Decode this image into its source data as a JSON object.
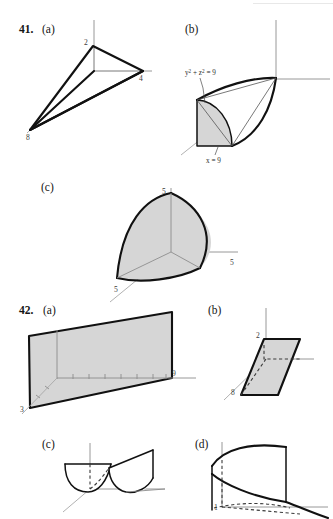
{
  "page": {
    "background_color": "#ffffff",
    "fill_color": "#d6d6d6",
    "edge_color": "#111111",
    "axis_color": "#8d8d8d"
  },
  "problems": [
    {
      "number": "41.",
      "parts": [
        {
          "label": "(a)",
          "shape": "tetrahedron",
          "vertex_labels": [
            "2",
            "4",
            "8"
          ],
          "description": "Tetrahedron with intercepts at 2 on z, 4 on y, 8 on x"
        },
        {
          "label": "(b)",
          "shape": "quarter-cylinder-wedge",
          "annotations": [
            {
              "text": "y² + z² = 9"
            },
            {
              "text": "x = 9"
            }
          ]
        },
        {
          "label": "(c)",
          "shape": "curved-octant-surface",
          "vertex_labels": [
            "5",
            "5",
            "5"
          ]
        }
      ]
    },
    {
      "number": "42.",
      "parts": [
        {
          "label": "(a)",
          "shape": "vertical-plane-sheet",
          "vertex_labels": [
            "9",
            "3"
          ],
          "tick_count": 8
        },
        {
          "label": "(b)",
          "shape": "slanted-parallelogram",
          "vertex_labels": [
            "2",
            "8"
          ]
        },
        {
          "label": "(c)",
          "shape": "paraboloid-trough-pair"
        },
        {
          "label": "(d)",
          "shape": "parabolic-cylinder-sheet",
          "vertex_labels": [
            "1"
          ]
        }
      ]
    }
  ],
  "labels": {
    "n41": "41.",
    "n42": "42.",
    "a": "(a)",
    "b": "(b)",
    "c": "(c)",
    "d": "(d)",
    "two": "2",
    "four": "4",
    "eight": "8",
    "five": "5",
    "nine": "9",
    "three": "3",
    "one": "1",
    "eq_ysq_zsq": "y² + z² = 9",
    "eq_x9": "x = 9"
  }
}
